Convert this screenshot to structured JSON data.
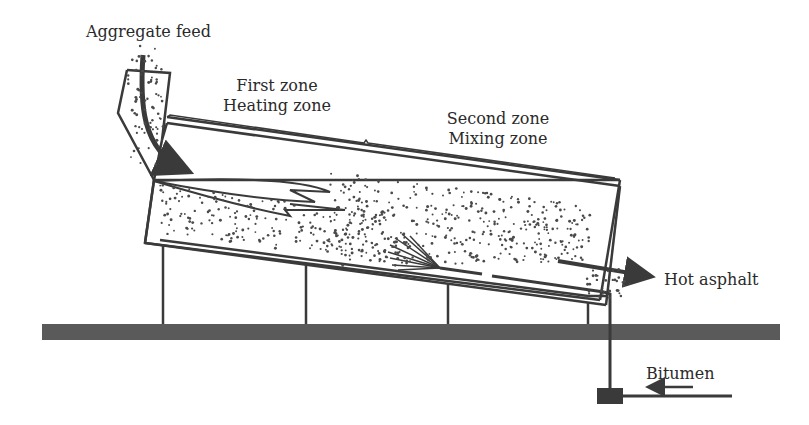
{
  "diagram": {
    "type": "drum-mix asphalt plant schematic",
    "labels": {
      "aggregate_feed": "Aggregate feed",
      "first_zone_line1": "First zone",
      "first_zone_line2": "Heating zone",
      "second_zone_line1": "Second zone",
      "second_zone_line2": "Mixing zone",
      "hot_asphalt": "Hot asphalt",
      "bitumen": "Bitumen"
    },
    "components": [
      {
        "name": "feed-chute",
        "description": "Inclined chute delivering aggregate into drum"
      },
      {
        "name": "rotating-drum",
        "description": "Inclined drum with heating and mixing zones"
      },
      {
        "name": "burner-flame",
        "description": "Flame in first (heating) zone"
      },
      {
        "name": "bitumen-spray",
        "description": "Bitumen injection spray in second (mixing) zone"
      },
      {
        "name": "bitumen-pipe",
        "description": "Pipe carrying bitumen into drum"
      },
      {
        "name": "bitumen-pump",
        "description": "Pump box below ground line"
      },
      {
        "name": "supports",
        "description": "Four vertical supports under drum"
      },
      {
        "name": "ground-base",
        "description": "Thick horizontal base/ground"
      }
    ],
    "colors": {
      "ink": "#3a3a3a",
      "ground": "#5a5a5a",
      "background": "#ffffff"
    }
  }
}
